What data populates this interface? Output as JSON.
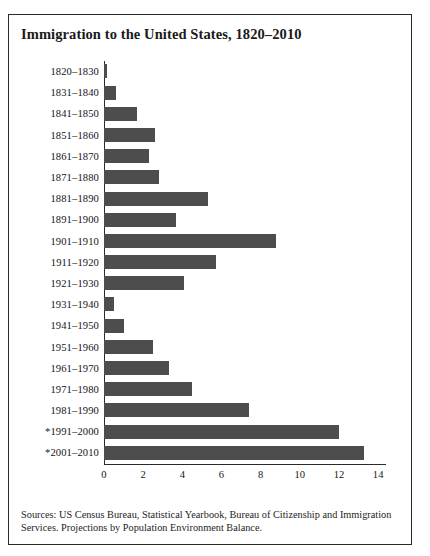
{
  "chart_data": {
    "type": "bar",
    "orientation": "horizontal",
    "title": "Immigration to the United States, 1820–2010",
    "xlabel": "",
    "ylabel": "",
    "xlim": [
      0,
      14.4
    ],
    "xticks": [
      0,
      2,
      4,
      6,
      8,
      10,
      12,
      14
    ],
    "xtick_labels": [
      "0",
      "2",
      "4",
      "6",
      "8",
      "10",
      "12",
      "14"
    ],
    "grid": false,
    "legend": null,
    "units": "millions of immigrants",
    "bar_color": "#4d4d4d",
    "categories": [
      "1820–1830",
      "1831–1840",
      "1841–1850",
      "1851–1860",
      "1861–1870",
      "1871–1880",
      "1881–1890",
      "1891–1900",
      "1901–1910",
      "1911–1920",
      "1921–1930",
      "1931–1940",
      "1941–1950",
      "1951–1960",
      "1961–1970",
      "1971–1980",
      "1981–1990",
      "*1991–2000",
      "*2001–2010"
    ],
    "values": [
      0.15,
      0.6,
      1.7,
      2.6,
      2.3,
      2.8,
      5.3,
      3.7,
      8.8,
      5.7,
      4.1,
      0.5,
      1.0,
      2.5,
      3.3,
      4.5,
      7.4,
      12.0,
      13.3
    ]
  },
  "source": {
    "line1": "Sources: US Census Bureau, Statistical Yearbook, Bureau of Citizenship and Immigration",
    "line2": "Services. Projections by Population Environment Balance."
  }
}
